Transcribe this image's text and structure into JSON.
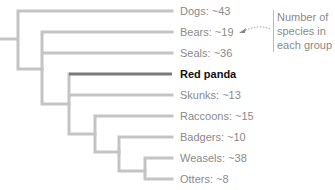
{
  "colors": {
    "branch": "#c4c4c4",
    "highlight": "#7a7a7a",
    "text": "#8a8a8a",
    "highlight_text": "#111111"
  },
  "leaves": [
    {
      "label": "Dogs: ~43",
      "highlight": false
    },
    {
      "label": "Bears: ~19",
      "highlight": false
    },
    {
      "label": "Seals: ~36",
      "highlight": false
    },
    {
      "label": "Red panda",
      "highlight": true
    },
    {
      "label": "Skunks: ~13",
      "highlight": false
    },
    {
      "label": "Raccoons: ~15",
      "highlight": false
    },
    {
      "label": "Badgers: ~10",
      "highlight": false
    },
    {
      "label": "Weasels: ~38",
      "highlight": false
    },
    {
      "label": "Otters: ~8",
      "highlight": false
    }
  ],
  "annotation": {
    "line1": "Number of",
    "line2": "species in",
    "line3": "each group"
  }
}
